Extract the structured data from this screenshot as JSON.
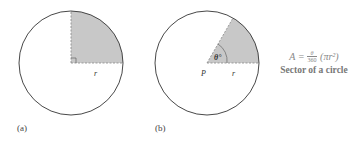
{
  "figures": [
    {
      "label": "(a)",
      "radius_label": "r",
      "angle": 90,
      "marker": "right-angle"
    },
    {
      "label": "(b)",
      "radius_label": "r",
      "center_label": "P",
      "angle_label": "θ°",
      "angle": 60
    }
  ],
  "formula": {
    "lhs": "A",
    "equals": "=",
    "num": "θ",
    "den": "360",
    "rest": "(πr²)",
    "caption": "Sector of a circle"
  },
  "colors": {
    "shade": "#c8c8c8",
    "stroke": "#333333"
  }
}
